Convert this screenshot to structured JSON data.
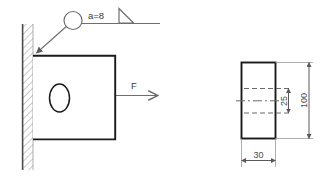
{
  "drawing": {
    "title": "Welded bracket plate with fillet weld symbol",
    "colors": {
      "outline_heavy": "#1a1a1a",
      "outline_light": "#6e6e6e",
      "dimension": "#5a5a5a",
      "hatch": "#8a8a8a",
      "background": "#ffffff",
      "hidden_line": "#6a6a6a"
    },
    "front_view": {
      "name": "front-view",
      "wall": {
        "name": "fixed-wall",
        "hatching": "diagonal"
      },
      "plate": {
        "name": "bracket-plate"
      },
      "hole": {
        "name": "oval-hole",
        "shape": "ellipse"
      },
      "force": {
        "label": "F",
        "direction": "right"
      },
      "weld_symbol": {
        "name": "fillet-weld-symbol",
        "throat_label": "a=8",
        "symbol": "fillet-triangle",
        "leader": "arrow-to-weld-joint"
      }
    },
    "side_view": {
      "name": "side-view",
      "dimensions": [
        {
          "name": "width-dimension",
          "value": "30",
          "orientation": "horizontal"
        },
        {
          "name": "hole-height-dimension",
          "value": "25",
          "orientation": "vertical"
        },
        {
          "name": "overall-height-dimension",
          "value": "100",
          "orientation": "vertical"
        }
      ],
      "hidden_lines": "hole-edges",
      "centerline": "horizontal-center-axis"
    }
  }
}
